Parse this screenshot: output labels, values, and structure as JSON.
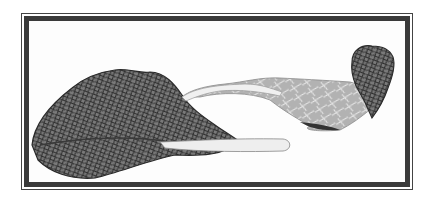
{
  "illustration": {
    "subject": "two mustard green leaves",
    "style": "engraved botanical illustration",
    "colors": {
      "frame": "#3a3a3a",
      "leaf_dark": "#5a5a5a",
      "leaf_light": "#b5b5b5",
      "stem": "#eeeeee",
      "background": "#ffffff"
    }
  }
}
